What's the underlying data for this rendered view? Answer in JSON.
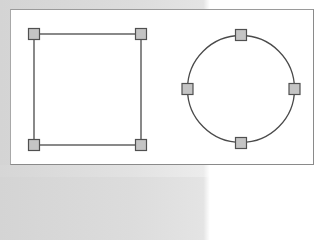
{
  "diagram": {
    "colors": {
      "background": "#d8d8d8",
      "canvas": "#ffffff",
      "canvas_border": "#8a8a8a",
      "shape_stroke": "#4a4a4a",
      "handle_fill": "#c4c4c4",
      "handle_stroke": "#505050"
    },
    "shapes": [
      {
        "type": "rectangle",
        "label": "square",
        "corners": [
          [
            34,
            34
          ],
          [
            141,
            34
          ],
          [
            141,
            145
          ],
          [
            34,
            145
          ]
        ],
        "handles": [
          "top-left",
          "top-right",
          "bottom-right",
          "bottom-left"
        ]
      },
      {
        "type": "circle",
        "label": "circle",
        "center": [
          241,
          89
        ],
        "radius": 53,
        "handles": [
          "top",
          "right",
          "bottom",
          "left"
        ]
      }
    ]
  }
}
